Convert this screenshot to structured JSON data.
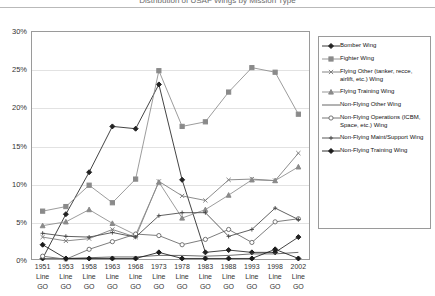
{
  "page": {
    "cut_title": "Distribution of USAF Wings by Mission Type"
  },
  "chart_data": {
    "type": "line",
    "title": "",
    "xlabel": "",
    "ylabel": "",
    "ylim": [
      0,
      30
    ],
    "ytick_labels": [
      "0%",
      "5%",
      "10%",
      "15%",
      "20%",
      "25%",
      "30%"
    ],
    "ytick_values": [
      0,
      5,
      10,
      15,
      20,
      25,
      30
    ],
    "grid": true,
    "legend_position": "right",
    "categories": [
      "1951 Line GO",
      "1953 Line GO",
      "1958 Line GO",
      "1963 Line GO",
      "1968 Line GO",
      "1973 Line GO",
      "1978 Line GO",
      "1983 Line GO",
      "1988 Line GO",
      "1993 Line GO",
      "1998 Line GO",
      "2002 Line GO"
    ],
    "category_years": [
      "1951",
      "1953",
      "1958",
      "1963",
      "1968",
      "1973",
      "1978",
      "1983",
      "1988",
      "1993",
      "1998",
      "2002"
    ],
    "category_line1": "Line",
    "category_line2": "GO",
    "series": [
      {
        "name": "Bomber Wing",
        "marker": "diamond-filled",
        "color": "#222222",
        "values": [
          0.2,
          6.0,
          11.5,
          17.5,
          17.2,
          23.0,
          10.5,
          1.0,
          1.3,
          1.0,
          1.0,
          3.0
        ]
      },
      {
        "name": "Fighter Wing",
        "marker": "square-filled",
        "color": "#8a8a8a",
        "values": [
          6.4,
          7.0,
          9.8,
          7.5,
          10.6,
          24.8,
          17.5,
          18.1,
          22.0,
          25.2,
          24.6,
          19.1
        ]
      },
      {
        "name": "Flying Other (tanker, recce, airlift, etc.) Wing",
        "marker": "cross",
        "color": "#777777",
        "values": [
          3.0,
          2.5,
          2.8,
          4.0,
          3.0,
          10.3,
          8.4,
          7.8,
          10.5,
          10.6,
          10.4,
          14.0
        ]
      },
      {
        "name": "Flying Training Wing",
        "marker": "triangle-filled",
        "color": "#8a8a8a",
        "values": [
          4.5,
          5.0,
          6.6,
          4.8,
          3.3,
          10.2,
          5.5,
          6.6,
          8.5,
          10.5,
          10.4,
          12.2
        ]
      },
      {
        "name": "Non-Flying Other Wing",
        "marker": "none",
        "color": "#555555",
        "values": [
          0.2,
          0.2,
          0.3,
          0.4,
          0.4,
          0.6,
          0.6,
          0.5,
          0.6,
          0.8,
          0.8,
          1.0
        ]
      },
      {
        "name": "Non-Flying Operations (ICBM, Space, etc.) Wing",
        "marker": "circle-open",
        "color": "#666666",
        "values": [
          0.5,
          0.1,
          1.4,
          2.4,
          3.4,
          3.2,
          2.0,
          2.7,
          4.0,
          2.3,
          5.0,
          5.4
        ]
      },
      {
        "name": "Non-Flying Maint/Support Wing",
        "marker": "plus",
        "color": "#444444",
        "values": [
          3.5,
          3.1,
          3.0,
          3.6,
          3.0,
          5.8,
          6.2,
          6.2,
          3.1,
          4.0,
          6.8,
          5.3
        ]
      },
      {
        "name": "Non-Flying Training Wing",
        "marker": "diamond-filled",
        "color": "#1a1a1a",
        "values": [
          2.0,
          0.2,
          0.2,
          0.2,
          0.2,
          1.0,
          0.2,
          0.2,
          0.2,
          0.2,
          1.4,
          0.2
        ]
      }
    ]
  }
}
